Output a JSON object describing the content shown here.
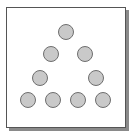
{
  "diagram": {
    "shape": "triangle-of-dots",
    "colors": {
      "background": "#ffffff",
      "frame_border": "#555555",
      "frame_shadow": "#8a8a8a",
      "dot_fill": "#c9c9c9",
      "dot_border": "#6e6e6e"
    },
    "dot_diameter": 16,
    "rows": [
      {
        "row": 1,
        "count": 1,
        "centers": [
          [
            66,
            32
          ]
        ]
      },
      {
        "row": 2,
        "count": 2,
        "centers": [
          [
            51,
            54
          ],
          [
            85,
            54
          ]
        ]
      },
      {
        "row": 3,
        "count": 2,
        "centers": [
          [
            40,
            78
          ],
          [
            96,
            78
          ]
        ]
      },
      {
        "row": 4,
        "count": 4,
        "centers": [
          [
            28,
            100
          ],
          [
            53,
            100
          ],
          [
            78,
            100
          ],
          [
            103,
            100
          ]
        ]
      }
    ],
    "total_dots": 9
  }
}
